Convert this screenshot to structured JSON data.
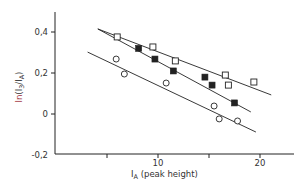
{
  "chart_data": {
    "type": "scatter",
    "title": "",
    "xlabel": "I_A (peak height)",
    "xlabel_main": "I",
    "xlabel_sub": "A",
    "xlabel_rest": " (peak height)",
    "ylabel": "ln(I3/IA)",
    "ylabel_ln": "ln",
    "ylabel_paren_open": "(I",
    "ylabel_sub1": "3",
    "ylabel_mid": "/I",
    "ylabel_sub2": "A",
    "ylabel_paren_close": ")",
    "xlim": [
      0,
      23.5
    ],
    "ylim": [
      -0.2,
      0.5
    ],
    "x_ticks": [
      5,
      10,
      15,
      20
    ],
    "x_tick_labels": [
      "",
      "10",
      "",
      "20"
    ],
    "y_ticks": [
      0.4,
      0.2,
      0,
      -0.2
    ],
    "y_tick_labels": [
      "0,4",
      "0,2",
      "0",
      "-0,2"
    ],
    "grid": false,
    "series": [
      {
        "name": "open-squares",
        "marker": "open-square",
        "points": [
          [
            6.0,
            0.376
          ],
          [
            9.5,
            0.327
          ],
          [
            11.7,
            0.259
          ],
          [
            16.6,
            0.19
          ],
          [
            16.9,
            0.141
          ],
          [
            19.4,
            0.156
          ]
        ],
        "fit_line": [
          [
            4.1,
            0.415
          ],
          [
            21.1,
            0.093
          ]
        ]
      },
      {
        "name": "filled-squares",
        "marker": "filled-square",
        "points": [
          [
            8.1,
            0.32
          ],
          [
            9.7,
            0.268
          ],
          [
            11.5,
            0.21
          ],
          [
            14.6,
            0.18
          ],
          [
            15.3,
            0.141
          ],
          [
            17.5,
            0.054
          ]
        ],
        "fit_line": [
          [
            4.1,
            0.415
          ],
          [
            19.1,
            0.01
          ]
        ]
      },
      {
        "name": "open-circles",
        "marker": "open-circle",
        "points": [
          [
            5.9,
            0.268
          ],
          [
            6.7,
            0.195
          ],
          [
            10.8,
            0.151
          ],
          [
            15.5,
            0.039
          ],
          [
            16.0,
            -0.024
          ],
          [
            17.8,
            -0.034
          ]
        ],
        "fit_line": [
          [
            3.1,
            0.302
          ],
          [
            19.6,
            -0.088
          ]
        ]
      }
    ],
    "colors": {
      "ink": "#222222",
      "ylabel_ln": "#a0303a"
    }
  }
}
